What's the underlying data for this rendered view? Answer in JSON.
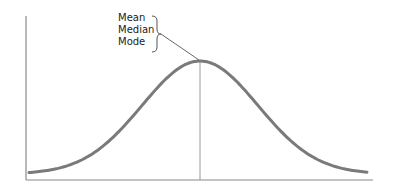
{
  "chart_data": {
    "type": "line",
    "title": "",
    "xlabel": "",
    "ylabel": "",
    "distribution": "normal",
    "annotations": [
      {
        "text": "Mean",
        "points_to": "peak"
      },
      {
        "text": "Median",
        "points_to": "peak"
      },
      {
        "text": "Mode",
        "points_to": "peak"
      }
    ],
    "grid": false,
    "ticks": false,
    "legend": null
  },
  "labels": {
    "mean": "Mean",
    "median": "Median",
    "mode": "Mode"
  },
  "colors": {
    "curve": "#7a7a7a",
    "axis": "#8a8a8a",
    "center_line": "#9a9a9a",
    "text": "#222222"
  },
  "geometry": {
    "origin_x": 26,
    "origin_y": 180,
    "axis_top": 16,
    "axis_right": 373,
    "peak_x": 200,
    "peak_y": 61,
    "base_y": 174,
    "sigma_px": 58,
    "curve_x_start": 29,
    "curve_x_end": 368
  }
}
